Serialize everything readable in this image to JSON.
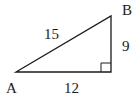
{
  "diagram": {
    "type": "right-triangle",
    "vertices": {
      "A": "A",
      "B": "B"
    },
    "sides": {
      "hypotenuse": "15",
      "vertical": "9",
      "base": "12"
    },
    "right_angle_marker": true,
    "stroke_color": "#1a1a1a"
  }
}
